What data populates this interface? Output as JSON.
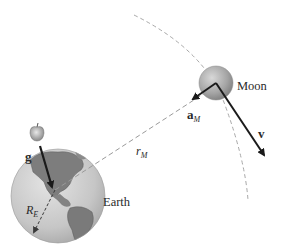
{
  "diagram": {
    "type": "physics-illustration",
    "colors": {
      "background": "#ffffff",
      "earth_ocean": "#c9c9c9",
      "earth_land": "#7d7d7d",
      "moon": "#a8a8a8",
      "vector": "#1a1a1a",
      "dashed": "#9a9a9a",
      "apple": "#b0b0b0"
    },
    "bodies": {
      "earth": {
        "label": "Earth",
        "center": [
          58,
          196
        ],
        "radius": 47
      },
      "moon": {
        "label": "Moon",
        "center": [
          216,
          83
        ],
        "radius": 17
      },
      "apple": {
        "center": [
          37,
          133
        ]
      }
    },
    "vectors": {
      "g": {
        "label": "g",
        "from": [
          40,
          146
        ],
        "to": [
          53,
          189
        ]
      },
      "a_M": {
        "label": "a",
        "subscript": "M",
        "from": [
          216,
          83
        ],
        "to": [
          190,
          101
        ]
      },
      "v": {
        "label": "v",
        "from": [
          216,
          83
        ],
        "to": [
          266,
          158
        ]
      }
    },
    "distances": {
      "r_M": {
        "label": "r",
        "subscript": "M",
        "from": [
          55,
          190
        ],
        "to": [
          216,
          86
        ]
      },
      "R_E": {
        "label": "R",
        "subscript": "E",
        "from": [
          55,
          190
        ],
        "to": [
          33,
          234
        ]
      }
    }
  }
}
